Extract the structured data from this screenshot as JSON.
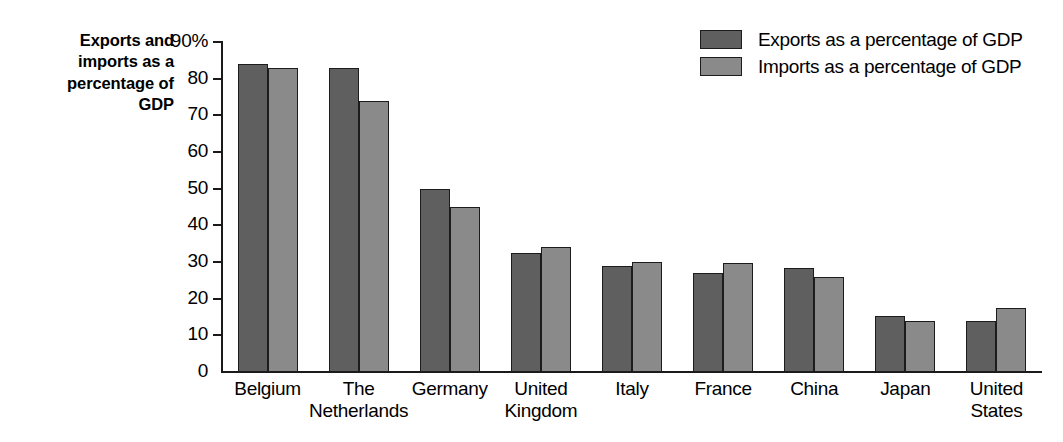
{
  "chart_data": {
    "type": "bar",
    "title": "Exports and imports as a percentage of GDP",
    "xlabel": "",
    "ylabel": "",
    "ylim": [
      0,
      90
    ],
    "grid": false,
    "legend_position": "top-right",
    "y_ticks": [
      "0",
      "10",
      "20",
      "30",
      "40",
      "50",
      "60",
      "70",
      "80",
      "90%"
    ],
    "y_tick_values": [
      0,
      10,
      20,
      30,
      40,
      50,
      60,
      70,
      80,
      90
    ],
    "categories": [
      "Belgium",
      "The\nNetherlands",
      "Germany",
      "United\nKingdom",
      "Italy",
      "France",
      "China",
      "Japan",
      "United\nStates"
    ],
    "series": [
      {
        "name": "Exports as a percentage of GDP",
        "color": "#5f5f5f",
        "values": [
          84,
          83,
          50,
          32.5,
          28.8,
          27,
          28.5,
          15.2,
          13.8
        ]
      },
      {
        "name": "Imports as a percentage of GDP",
        "color": "#8a8a8a",
        "values": [
          83,
          74,
          45,
          34,
          30,
          29.7,
          26,
          14,
          17.5
        ]
      }
    ]
  },
  "axis_title": {
    "line1": "Exports and",
    "line2": "imports as a",
    "line3": "percentage of",
    "line4": "GDP"
  },
  "legend": {
    "items": [
      {
        "label": "Exports as a percentage of GDP",
        "swatch": "exports"
      },
      {
        "label": "Imports as a percentage of GDP",
        "swatch": "imports"
      }
    ]
  }
}
